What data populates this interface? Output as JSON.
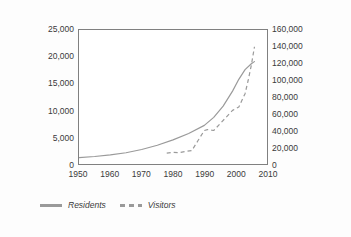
{
  "chart_data": {
    "type": "line",
    "title": "",
    "subtitle": "",
    "xlabel": "",
    "ylabel": "",
    "y2label": "",
    "grid": false,
    "legend_position": "bottom-left",
    "xlim": [
      1950,
      2010
    ],
    "ylim": [
      0,
      25000
    ],
    "y2lim": [
      0,
      160000
    ],
    "x_ticks": [
      "1950",
      "1960",
      "1970",
      "1980",
      "1990",
      "2000",
      "2010"
    ],
    "y_left_ticks": [
      "0",
      "5,000",
      "10,000",
      "15,000",
      "20,000",
      "25,000"
    ],
    "y_right_ticks": [
      "0",
      "20,000",
      "40,000",
      "60,000",
      "80,000",
      "100,000",
      "120,000",
      "140,000",
      "160,000"
    ],
    "series": [
      {
        "name": "Residents",
        "axis": "left",
        "style": "solid",
        "color": "#9a9a9a",
        "x": [
          1950,
          1955,
          1960,
          1965,
          1970,
          1975,
          1980,
          1985,
          1990,
          1993,
          1996,
          1999,
          2001,
          2003,
          2005,
          2006
        ],
        "values": [
          1200,
          1400,
          1700,
          2100,
          2700,
          3500,
          4500,
          5700,
          7200,
          8700,
          10800,
          13600,
          15800,
          17600,
          18700,
          19100
        ]
      },
      {
        "name": "Visitors",
        "axis": "right",
        "style": "dashed",
        "color": "#9a9a9a",
        "x": [
          1978,
          1980,
          1982,
          1984,
          1986,
          1988,
          1990,
          1991,
          1993,
          1995,
          1997,
          1999,
          2001,
          2003,
          2004,
          2005,
          2006
        ],
        "values": [
          13000,
          14000,
          13500,
          15000,
          16000,
          28000,
          40000,
          41000,
          40000,
          48000,
          56000,
          64000,
          68000,
          84000,
          100000,
          118000,
          140000
        ]
      }
    ]
  },
  "legend": {
    "items": [
      {
        "label": "Residents",
        "style": "solid"
      },
      {
        "label": "Visitors",
        "style": "dashed"
      }
    ]
  }
}
